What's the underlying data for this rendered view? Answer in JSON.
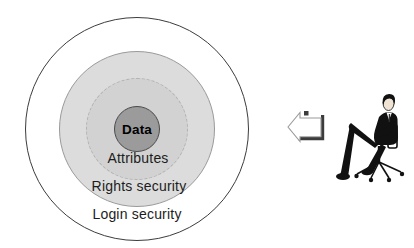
{
  "diagram": {
    "rings": [
      {
        "label": "Login security",
        "fill": "#ffffff",
        "border": "#3c3c3c",
        "border_style": "solid"
      },
      {
        "label": "Rights security",
        "fill": "#dcdcdc",
        "border": "#9a9a9a",
        "border_style": "solid"
      },
      {
        "label": "Attributes",
        "fill": "#d2d2d2",
        "border": "#b2b2b2",
        "border_style": "dashed"
      },
      {
        "label": "Data",
        "fill": "#9b9b9b",
        "border": "#4a4a4a",
        "border_style": "solid"
      }
    ]
  },
  "side": {
    "arrow_icon": "left-block-arrow",
    "arrow_outline": "#9a9a9a",
    "arrow_shadow": "#3c3c3c",
    "figure": "businessman-seated-on-office-chair",
    "figure_suit_color": "#111111"
  }
}
